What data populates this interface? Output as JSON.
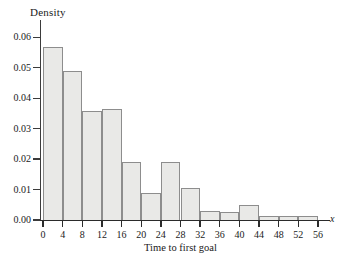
{
  "chart_data": {
    "type": "bar",
    "title": "",
    "subtitle": "",
    "xlabel": "Time to first goal",
    "ylabel": "Density",
    "x_axis_name": "x",
    "xlim": [
      0,
      56
    ],
    "ylim": [
      0.0,
      0.065
    ],
    "grid": false,
    "legend": null,
    "bin_width": 4,
    "bin_edges": [
      0,
      4,
      8,
      12,
      16,
      20,
      24,
      28,
      32,
      36,
      40,
      44,
      48,
      52,
      56
    ],
    "categories": [
      "0-4",
      "4-8",
      "8-12",
      "12-16",
      "16-20",
      "20-24",
      "24-28",
      "28-32",
      "32-36",
      "36-40",
      "40-44",
      "44-48",
      "48-52",
      "52-56"
    ],
    "values": [
      0.0567,
      0.0488,
      0.0357,
      0.0366,
      0.019,
      0.0089,
      0.019,
      0.0105,
      0.003,
      0.0025,
      0.005,
      0.0012,
      0.0012,
      0.0012
    ],
    "x_ticks": [
      0,
      4,
      8,
      12,
      16,
      20,
      24,
      28,
      32,
      36,
      40,
      44,
      48,
      52,
      56
    ],
    "x_tick_labels": [
      "0",
      "4",
      "8",
      "12",
      "16",
      "20",
      "24",
      "28",
      "32",
      "36",
      "40",
      "44",
      "48",
      "52",
      "56"
    ],
    "y_ticks": [
      0.0,
      0.01,
      0.02,
      0.03,
      0.04,
      0.05,
      0.06
    ],
    "y_tick_labels": [
      "0.00",
      "0.01",
      "0.02",
      "0.03",
      "0.04",
      "0.05",
      "0.06"
    ],
    "colors": {
      "bar_fill": "#e9e9e7",
      "bar_edge": "#8d8d8d",
      "axis": "#2b2b2b",
      "text": "#1a1a1a",
      "background": "#ffffff"
    }
  }
}
